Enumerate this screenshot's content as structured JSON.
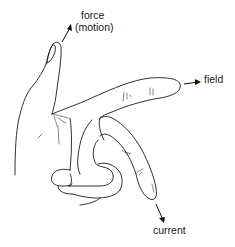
{
  "diagram": {
    "labels": {
      "force": "force",
      "motion": "(motion)",
      "field": "field",
      "current": "current"
    },
    "colors": {
      "ink": "#1a1a1a",
      "background": "#ffffff"
    }
  }
}
